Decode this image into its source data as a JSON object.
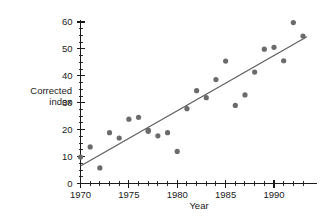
{
  "chart_data": {
    "type": "scatter",
    "title": "",
    "xlabel": "Year",
    "ylabel": "Corrected index",
    "ylabel_line1": "Corrected",
    "ylabel_line2": "index",
    "xlim": [
      1969.6,
      1993.6
    ],
    "ylim": [
      0,
      62
    ],
    "grid": false,
    "legend": false,
    "x_ticks_major": [
      1970,
      1975,
      1980,
      1985,
      1990
    ],
    "x_tick_labels": [
      "1970",
      "1975",
      "1980",
      "1985",
      "1990"
    ],
    "x_ticks_minor": [
      1971,
      1972,
      1973,
      1974,
      1976,
      1977,
      1978,
      1979,
      1981,
      1982,
      1983,
      1984,
      1986,
      1987,
      1988,
      1989,
      1991,
      1992,
      1993
    ],
    "y_ticks_major": [
      0,
      10,
      20,
      30,
      40,
      50,
      60
    ],
    "y_tick_labels": [
      "0",
      "10",
      "20",
      "30",
      "40",
      "50",
      "60"
    ],
    "y_ticks_minor": [
      2.5,
      5,
      7.5,
      12.5,
      15,
      17.5,
      22.5,
      25,
      27.5,
      32.5,
      35,
      37.5,
      42.5,
      45,
      47.5,
      52.5,
      55,
      57.5
    ],
    "x": [
      1970,
      1971,
      1972,
      1973,
      1974,
      1975,
      1976,
      1977,
      1977,
      1978,
      1979,
      1980,
      1981,
      1982,
      1983,
      1984,
      1985,
      1986,
      1987,
      1988,
      1989,
      1990,
      1991,
      1992,
      1993
    ],
    "y": [
      9.8,
      13.6,
      5.8,
      18.9,
      16.9,
      23.9,
      24.6,
      19.8,
      19.4,
      17.7,
      18.9,
      11.9,
      27.8,
      34.5,
      31.9,
      38.6,
      45.5,
      29.0,
      32.9,
      41.4,
      49.9,
      50.6,
      45.6,
      59.8,
      54.8
    ],
    "points": [
      {
        "x": 1970,
        "y": 9.8
      },
      {
        "x": 1971,
        "y": 13.6
      },
      {
        "x": 1972,
        "y": 5.8
      },
      {
        "x": 1973,
        "y": 18.9
      },
      {
        "x": 1974,
        "y": 16.9
      },
      {
        "x": 1975,
        "y": 23.9
      },
      {
        "x": 1976,
        "y": 24.6
      },
      {
        "x": 1977,
        "y": 19.8
      },
      {
        "x": 1977,
        "y": 19.4
      },
      {
        "x": 1978,
        "y": 17.7
      },
      {
        "x": 1979,
        "y": 18.9
      },
      {
        "x": 1980,
        "y": 11.9
      },
      {
        "x": 1981,
        "y": 27.8
      },
      {
        "x": 1982,
        "y": 34.5
      },
      {
        "x": 1983,
        "y": 31.9
      },
      {
        "x": 1984,
        "y": 38.6
      },
      {
        "x": 1985,
        "y": 45.5
      },
      {
        "x": 1986,
        "y": 29.0
      },
      {
        "x": 1987,
        "y": 32.9
      },
      {
        "x": 1988,
        "y": 41.4
      },
      {
        "x": 1989,
        "y": 49.9
      },
      {
        "x": 1990,
        "y": 50.6
      },
      {
        "x": 1991,
        "y": 45.6
      },
      {
        "x": 1992,
        "y": 59.8
      },
      {
        "x": 1993,
        "y": 54.8
      }
    ],
    "trend_line": {
      "x_start": 1970,
      "y_start": 6.5,
      "x_end": 1993.4,
      "y_end": 54.5
    },
    "colors": {
      "marker": "#6b6b6b",
      "trend": "#5a5a5a",
      "axis": "#1a1a1a",
      "background": "#ffffff"
    },
    "marker_radius_px": 2.6
  }
}
